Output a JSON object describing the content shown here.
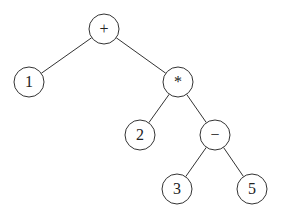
{
  "diagram": {
    "type": "expression-tree",
    "nodes": [
      {
        "id": "n_plus",
        "label": "+",
        "x": 104,
        "y": 29
      },
      {
        "id": "n_1",
        "label": "1",
        "x": 29,
        "y": 82
      },
      {
        "id": "n_mul",
        "label": "*",
        "x": 178,
        "y": 82
      },
      {
        "id": "n_2",
        "label": "2",
        "x": 140,
        "y": 135
      },
      {
        "id": "n_minus",
        "label": "−",
        "x": 215,
        "y": 135
      },
      {
        "id": "n_3",
        "label": "3",
        "x": 177,
        "y": 189
      },
      {
        "id": "n_5",
        "label": "5",
        "x": 252,
        "y": 189
      }
    ],
    "edges": [
      [
        "n_plus",
        "n_1"
      ],
      [
        "n_plus",
        "n_mul"
      ],
      [
        "n_mul",
        "n_2"
      ],
      [
        "n_mul",
        "n_minus"
      ],
      [
        "n_minus",
        "n_3"
      ],
      [
        "n_minus",
        "n_5"
      ]
    ],
    "node_radius": 15,
    "stroke_color": "#333333",
    "fill_color": "#ffffff"
  }
}
